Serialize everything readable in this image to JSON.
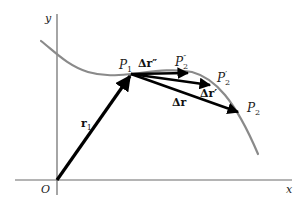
{
  "diagram": {
    "axes": {
      "x_label": "x",
      "y_label": "y",
      "origin_label": "O"
    },
    "points": {
      "p1": {
        "base": "P",
        "sub": "1"
      },
      "p2": {
        "base": "P",
        "sub": "2"
      },
      "p2_prime": {
        "base": "P",
        "sub": "2",
        "sup": "′"
      },
      "p2_double_prime": {
        "base": "P",
        "sub": "2",
        "sup": "″"
      }
    },
    "vectors": {
      "r1": {
        "base": "r",
        "sub": "1"
      },
      "delta_r": {
        "text": "Δr"
      },
      "delta_r_prime": {
        "text": "Δr′"
      },
      "delta_r_double_prime": {
        "text": "Δr″"
      }
    },
    "colors": {
      "curve": "#8a8a8a",
      "axes": "#666666",
      "vectors": "#000000"
    }
  }
}
